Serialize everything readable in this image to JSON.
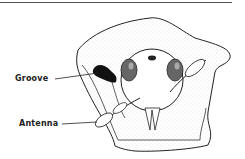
{
  "figure": {
    "labels": [
      {
        "id": "groove",
        "text": "Groove"
      },
      {
        "id": "antenna",
        "text": "Antenna"
      }
    ]
  },
  "colors": {
    "ink": "#222222",
    "paper": "#ffffff",
    "rule": "#555555"
  }
}
